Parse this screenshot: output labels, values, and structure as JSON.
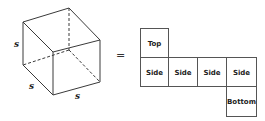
{
  "figure": {
    "cube": {
      "edge_labels": {
        "vertical": "s",
        "depth": "s",
        "width": "s"
      }
    },
    "equals_sign": "=",
    "net": {
      "cells": [
        {
          "id": "top",
          "label": "Top"
        },
        {
          "id": "side-1",
          "label": "Side"
        },
        {
          "id": "side-2",
          "label": "Side"
        },
        {
          "id": "side-3",
          "label": "Side"
        },
        {
          "id": "side-4",
          "label": "Side"
        },
        {
          "id": "bottom",
          "label": "Bottom"
        }
      ]
    }
  }
}
